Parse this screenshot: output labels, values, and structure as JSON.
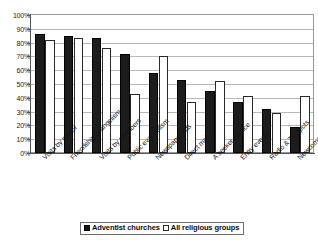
{
  "chart_data": {
    "type": "bar",
    "title": "",
    "xlabel": "",
    "ylabel": "",
    "ylim": [
      0,
      100
    ],
    "grid": true,
    "legend_position": "bottom",
    "y_tick_labels": [
      "100%",
      "90%",
      "80%",
      "70%",
      "60%",
      "50%",
      "40%",
      "30%",
      "20%",
      "10%",
      "0%"
    ],
    "y_tick_values": [
      100,
      90,
      80,
      70,
      60,
      50,
      40,
      30,
      20,
      10,
      0
    ],
    "categories": [
      "Visits by pastor",
      "Friendship evangelism",
      "Visits by members",
      "Public evangelism",
      "Newspaper ads",
      "Direct mail",
      "A seeker service",
      "Entry events",
      "Radio & TV spots",
      "Newcomer outreach"
    ],
    "series": [
      {
        "name": "Adventist churches",
        "color": "#1c1c1c",
        "style": "filled",
        "values": [
          86,
          85,
          83,
          72,
          58,
          53,
          45,
          37,
          32,
          19
        ]
      },
      {
        "name": "All religious groups",
        "color": "#ffffff",
        "style": "hollow",
        "values": [
          82,
          83,
          76,
          43,
          70,
          37,
          52,
          41,
          29,
          41
        ]
      }
    ]
  },
  "legend": {
    "entries": [
      {
        "label": "Adventist churches",
        "swatch": "filled-square-icon"
      },
      {
        "label": "All religious groups",
        "swatch": "hollow-square-icon"
      }
    ]
  }
}
